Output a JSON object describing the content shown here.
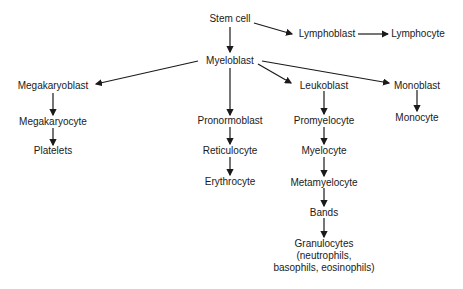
{
  "diagram": {
    "type": "hematopoiesis-flowchart",
    "nodes": {
      "stem_cell": "Stem cell",
      "lymphoblast": "Lymphoblast",
      "lymphocyte": "Lymphocyte",
      "myeloblast": "Myeloblast",
      "megakaryoblast": "Megakaryoblast",
      "megakaryocyte": "Megakaryocyte",
      "platelets": "Platelets",
      "pronormoblast": "Pronormoblast",
      "reticulocyte": "Reticulocyte",
      "erythrocyte": "Erythrocyte",
      "leukoblast": "Leukoblast",
      "promyelocyte": "Promyelocyte",
      "myelocyte": "Myelocyte",
      "metamyelocyte": "Metamyelocyte",
      "bands": "Bands",
      "granulocytes": "Granulocytes",
      "granulocytes_detail_1": "(neutrophils,",
      "granulocytes_detail_2": "basophils, eosinophils)",
      "monoblast": "Monoblast",
      "monocyte": "Monocyte"
    },
    "edges": [
      [
        "stem_cell",
        "lymphoblast"
      ],
      [
        "lymphoblast",
        "lymphocyte"
      ],
      [
        "stem_cell",
        "myeloblast"
      ],
      [
        "myeloblast",
        "megakaryoblast"
      ],
      [
        "megakaryoblast",
        "megakaryocyte"
      ],
      [
        "megakaryocyte",
        "platelets"
      ],
      [
        "myeloblast",
        "pronormoblast"
      ],
      [
        "pronormoblast",
        "reticulocyte"
      ],
      [
        "reticulocyte",
        "erythrocyte"
      ],
      [
        "myeloblast",
        "leukoblast"
      ],
      [
        "leukoblast",
        "promyelocyte"
      ],
      [
        "promyelocyte",
        "myelocyte"
      ],
      [
        "myelocyte",
        "metamyelocyte"
      ],
      [
        "metamyelocyte",
        "bands"
      ],
      [
        "bands",
        "granulocytes"
      ],
      [
        "myeloblast",
        "monoblast"
      ],
      [
        "monoblast",
        "monocyte"
      ]
    ]
  }
}
